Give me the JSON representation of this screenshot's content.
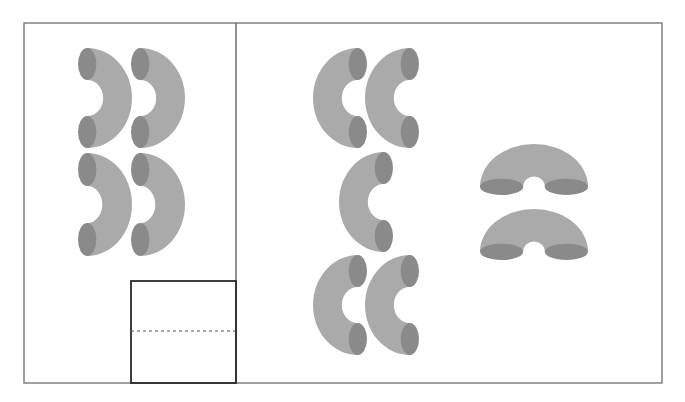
{
  "canvas": {
    "width": 685,
    "height": 402,
    "background": "#ffffff"
  },
  "colors": {
    "frame": "#6e6e6e",
    "inset": "#2a2a2a",
    "body": "#aaaaaa",
    "end": "#8a8a8a",
    "dash": "#555555"
  },
  "frame": {
    "x": 24,
    "y": 23,
    "w": 638,
    "h": 360
  },
  "divider": {
    "x": 236,
    "y1": 23,
    "y2": 383
  },
  "inset_box": {
    "x": 131,
    "y": 281,
    "w": 105,
    "h": 102,
    "dashed_y": 331
  },
  "left_panel": {
    "label": "bends opening left (reverse-C)",
    "bends": [
      {
        "orientation": "right",
        "x": 78,
        "y": 48,
        "w": 54,
        "h": 100
      },
      {
        "orientation": "right",
        "x": 131,
        "y": 48,
        "w": 54,
        "h": 100
      },
      {
        "orientation": "right",
        "x": 78,
        "y": 153,
        "w": 54,
        "h": 103
      },
      {
        "orientation": "right",
        "x": 131,
        "y": 153,
        "w": 54,
        "h": 103
      }
    ]
  },
  "middle_group": {
    "label": "bends opening right (C)",
    "bends": [
      {
        "orientation": "left",
        "x": 313,
        "y": 48,
        "w": 54,
        "h": 100
      },
      {
        "orientation": "left",
        "x": 365,
        "y": 48,
        "w": 54,
        "h": 100
      },
      {
        "orientation": "left",
        "x": 339,
        "y": 152,
        "w": 54,
        "h": 100
      },
      {
        "orientation": "left",
        "x": 313,
        "y": 255,
        "w": 54,
        "h": 100
      },
      {
        "orientation": "left",
        "x": 365,
        "y": 255,
        "w": 54,
        "h": 100
      }
    ]
  },
  "right_group": {
    "label": "bends opening down (arch)",
    "bends": [
      {
        "orientation": "up",
        "x": 480,
        "y": 144,
        "w": 108,
        "h": 51
      },
      {
        "orientation": "up",
        "x": 480,
        "y": 209,
        "w": 108,
        "h": 51
      }
    ]
  }
}
